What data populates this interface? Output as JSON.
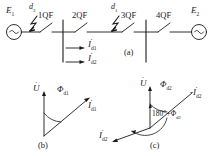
{
  "figure": {
    "type": "power-system-single-line-and-phasor-diagram",
    "panels": [
      {
        "id": "a",
        "caption": "(a)",
        "description": "single line diagram with two sources, four circuit breakers and two fault points"
      },
      {
        "id": "b",
        "caption": "(b)",
        "description": "phasor diagram for fault d1"
      },
      {
        "id": "c",
        "caption": "(c)",
        "description": "phasor diagram for fault d2"
      }
    ]
  },
  "single_line": {
    "sources": [
      {
        "name": "source-left",
        "label": "E",
        "sub": "1",
        "symbol": "ac-source-sine"
      },
      {
        "name": "source-right",
        "label": "E",
        "sub": "2",
        "symbol": "ac-source-sine"
      }
    ],
    "breakers": [
      {
        "label": "1QF"
      },
      {
        "label": "2QF"
      },
      {
        "label": "3QF"
      },
      {
        "label": "4QF"
      }
    ],
    "faults": [
      {
        "label": "d",
        "sub": "2",
        "symbol": "lightning-fault"
      },
      {
        "label": "d",
        "sub": "1",
        "symbol": "lightning-fault"
      }
    ],
    "currents": [
      {
        "label": "I",
        "sub": "d1",
        "arrow": "right",
        "phasor_dot": true
      },
      {
        "label": "I",
        "sub": "d2",
        "arrow": "right",
        "phasor_dot": true
      }
    ],
    "caption": "(a)"
  },
  "phasor_b": {
    "caption": "(b)",
    "voltage": {
      "label": "U",
      "sub": "",
      "phasor_dot": true
    },
    "current": {
      "label": "I",
      "sub": "d1",
      "phasor_dot": true
    },
    "angle": {
      "label": "Φ",
      "sub": "d1"
    }
  },
  "phasor_c": {
    "caption": "(c)",
    "voltage": {
      "label": "U",
      "sub": "",
      "phasor_dot": true
    },
    "current_neg": {
      "label": "-I",
      "sub": "d2",
      "phasor_dot": true
    },
    "current": {
      "label": "I",
      "sub": "d2",
      "phasor_dot": true
    },
    "angle": {
      "label": "Φ",
      "sub": "d2"
    },
    "angle_big": {
      "prefix": "180°+",
      "label": "Φ",
      "sub": "d2"
    }
  },
  "colors": {
    "line": "#1a1a1a",
    "text": "#1a1a1a",
    "background": "#ffffff"
  }
}
